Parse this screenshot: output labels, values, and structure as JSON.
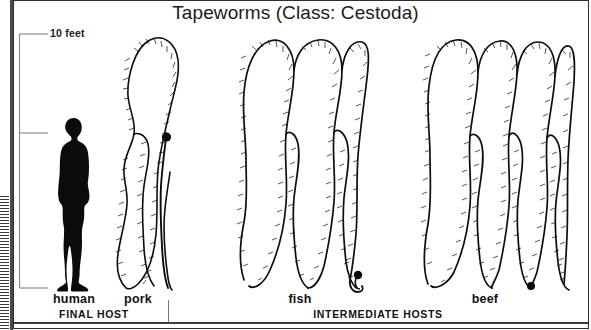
{
  "figure": {
    "title": "Tapeworms (Class: Cestoda)",
    "scale_label": "10 feet",
    "background_color": "#ffffff",
    "ink_color": "#0d0d0d",
    "border_color": "#2e2e2e"
  },
  "scale": {
    "label": "10 feet",
    "tick_count": 3,
    "ticks": [
      "top",
      "middle",
      "bottom"
    ]
  },
  "specimens": [
    {
      "label": "human",
      "icon": "human-silhouette-icon",
      "loops": 0,
      "has_head_knob": false
    },
    {
      "label": "pork",
      "icon": "tapeworm-pork-icon",
      "loops": 2,
      "has_head_knob": true
    },
    {
      "label": "fish",
      "icon": "tapeworm-fish-icon",
      "loops": 3,
      "has_head_knob": true
    },
    {
      "label": "beef",
      "icon": "tapeworm-beef-icon",
      "loops": 4,
      "has_head_knob": true
    }
  ],
  "host_groups": [
    {
      "label": "FINAL HOST",
      "members": [
        "human"
      ]
    },
    {
      "label": "INTERMEDIATE HOSTS",
      "members": [
        "pork",
        "fish",
        "beef"
      ]
    }
  ]
}
